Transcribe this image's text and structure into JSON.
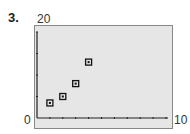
{
  "problem": {
    "number": "3."
  },
  "window": {
    "ymax_label": "20",
    "xmin_label": "0",
    "xmax_label": "10"
  },
  "chart_data": {
    "type": "scatter",
    "title": "",
    "xlabel": "",
    "ylabel": "",
    "xlim": [
      0,
      10
    ],
    "ylim": [
      0,
      20
    ],
    "xticks": [
      1,
      2,
      3,
      4,
      5,
      6,
      7,
      8,
      9,
      10
    ],
    "yticks": [
      5,
      10,
      15,
      20
    ],
    "grid": false,
    "series": [
      {
        "name": "data",
        "x": [
          1,
          2,
          3,
          4
        ],
        "y": [
          3.5,
          5,
          8,
          13
        ],
        "marker": "square"
      }
    ]
  }
}
